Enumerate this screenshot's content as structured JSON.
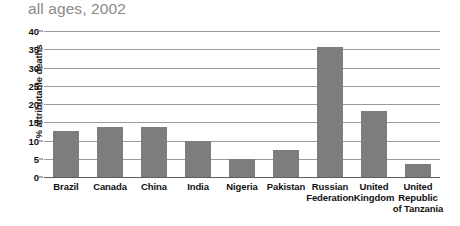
{
  "figure": {
    "title": "all ages, 2002",
    "clipped_title_fragment": "attributable deaths, both sexes,",
    "bar_color": "#7d7d7d",
    "gridline_color": "#9b9b9b",
    "title_color": "#8a8a8a"
  },
  "chart_data": {
    "type": "bar",
    "title": "all ages, 2002",
    "xlabel": "",
    "ylabel": "% attributable deaths",
    "ylim": [
      0,
      40
    ],
    "yticks": [
      0,
      5,
      10,
      15,
      20,
      25,
      30,
      35,
      40
    ],
    "ytick_labels": [
      "0",
      "5",
      "10",
      "15",
      "20",
      "25",
      "30",
      "35",
      "40"
    ],
    "grid": true,
    "legend": "none",
    "categories": [
      "Brazil",
      "Canada",
      "China",
      "India",
      "Nigeria",
      "Pakistan",
      "Russian Federation",
      "United Kingdom",
      "United Republic of Tanzania"
    ],
    "category_lines": [
      [
        "Brazil"
      ],
      [
        "Canada"
      ],
      [
        "China"
      ],
      [
        "India"
      ],
      [
        "Nigeria"
      ],
      [
        "Pakistan"
      ],
      [
        "Russian",
        "Federation"
      ],
      [
        "United",
        "Kingdom"
      ],
      [
        "United",
        "Republic",
        "of Tanzania"
      ]
    ],
    "values": [
      12.6,
      13.8,
      13.7,
      10.0,
      5.0,
      7.3,
      35.5,
      18.0,
      3.7
    ]
  }
}
